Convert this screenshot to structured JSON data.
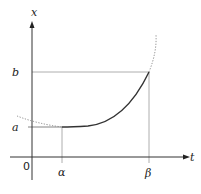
{
  "diagram": {
    "axes": {
      "horizontal_label": "t",
      "vertical_label": "x",
      "origin_label": "0"
    },
    "ticks": {
      "t_alpha": "α",
      "t_beta": "β",
      "x_a": "a",
      "x_b": "b"
    },
    "curve": {
      "description": "Convex increasing curve from (α, a) to (β, b); dotted extensions outside [α, β]",
      "solid_color": "#333333",
      "dotted_color": "#888888"
    },
    "guide_line_color": "#999999",
    "axis_color": "#333333"
  }
}
